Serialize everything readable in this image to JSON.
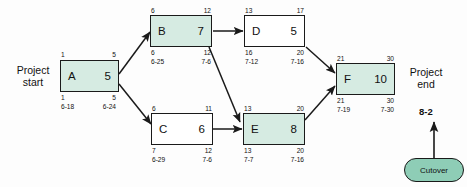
{
  "diagram": {
    "start_label": "Project\nstart",
    "start_label_line1": "Project",
    "start_label_line2": "start",
    "end_label_line1": "Project",
    "end_label_line2": "end",
    "milestone": "8-2",
    "cutover_label": "Cutover",
    "colors": {
      "node_fill_critical": "#d6ebe2",
      "node_fill_normal": "#ffffff",
      "cutover_fill": "#8ecdb6",
      "stroke": "#1a1a1a"
    }
  },
  "nodes": [
    {
      "id": "A",
      "name": "A",
      "duration": "5",
      "early_start": "1",
      "early_finish": "5",
      "late_start": "1",
      "late_finish": "5",
      "start_date": "6-18",
      "finish_date": "6-24",
      "fill": "green"
    },
    {
      "id": "B",
      "name": "B",
      "duration": "7",
      "early_start": "6",
      "early_finish": "12",
      "late_start": "6",
      "late_finish": "12",
      "start_date": "6-25",
      "finish_date": "7-6",
      "fill": "green"
    },
    {
      "id": "C",
      "name": "C",
      "duration": "6",
      "early_start": "6",
      "early_finish": "11",
      "late_start": "7",
      "late_finish": "12",
      "start_date": "6-29",
      "finish_date": "7-6",
      "fill": "white"
    },
    {
      "id": "D",
      "name": "D",
      "duration": "5",
      "early_start": "13",
      "early_finish": "17",
      "late_start": "16",
      "late_finish": "20",
      "start_date": "7-12",
      "finish_date": "7-16",
      "fill": "white"
    },
    {
      "id": "E",
      "name": "E",
      "duration": "8",
      "early_start": "13",
      "early_finish": "20",
      "late_start": "13",
      "late_finish": "20",
      "start_date": "7-7",
      "finish_date": "7-16",
      "fill": "green"
    },
    {
      "id": "F",
      "name": "F",
      "duration": "10",
      "early_start": "21",
      "early_finish": "30",
      "late_start": "21",
      "late_finish": "30",
      "start_date": "7-19",
      "finish_date": "7-30",
      "fill": "green"
    }
  ],
  "edges": [
    {
      "from": "A",
      "to": "B"
    },
    {
      "from": "A",
      "to": "C"
    },
    {
      "from": "B",
      "to": "D"
    },
    {
      "from": "B",
      "to": "E"
    },
    {
      "from": "C",
      "to": "E"
    },
    {
      "from": "D",
      "to": "F"
    },
    {
      "from": "E",
      "to": "F"
    },
    {
      "from": "Cutover",
      "to": "8-2"
    }
  ]
}
